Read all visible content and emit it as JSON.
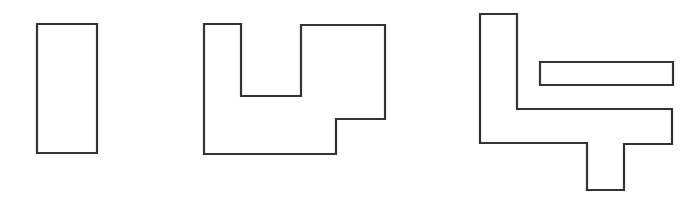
{
  "diagram": {
    "background": "#ffffff",
    "stroke_color": "#333333",
    "shapes": [
      {
        "id": "shape-1",
        "kind": "rectangle",
        "points": "37,24 97,24 97,153 37,153"
      },
      {
        "id": "shape-2",
        "kind": "u-notched-polygon",
        "points": "204,24 241,24 241,96 301,96 301,25 385,25 385,119 336,119 336,154 204,154"
      },
      {
        "id": "shape-3a",
        "kind": "l-t-polygon",
        "points": "480,14 517,14 517,109 672,109 672,144 624,144 624,190 587,190 587,143 480,143"
      },
      {
        "id": "shape-3b",
        "kind": "bar",
        "points": "540,62 673,62 673,85 540,85"
      }
    ]
  }
}
